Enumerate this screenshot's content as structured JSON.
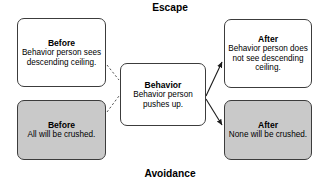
{
  "diagram": {
    "band_top_label": "Escape",
    "band_bottom_label": "Avoidance",
    "nodes": {
      "before_escape": {
        "title": "Before",
        "body": "Behavior person sees descending ceiling.",
        "fill": "#ffffff"
      },
      "before_avoidance": {
        "title": "Before",
        "body": "All will be crushed.",
        "fill": "#c9c9c9"
      },
      "behavior": {
        "title": "Behavior",
        "body": "Behavior person pushes up.",
        "fill": "#ffffff"
      },
      "after_escape": {
        "title": "After",
        "body": "Behavior person does not see descending ceiling.",
        "fill": "#ffffff"
      },
      "after_avoidance": {
        "title": "After",
        "body": "None will be crushed.",
        "fill": "#c9c9c9"
      }
    },
    "connectors": [
      {
        "name": "before-escape-to-behavior",
        "style": "dashed",
        "arrowhead": false
      },
      {
        "name": "before-avoidance-to-behavior",
        "style": "dashed",
        "arrowhead": false
      },
      {
        "name": "behavior-to-after-escape",
        "style": "solid",
        "arrowhead": true
      },
      {
        "name": "behavior-to-after-avoidance",
        "style": "solid",
        "arrowhead": true
      }
    ],
    "colors": {
      "stroke": "#3c3c3c",
      "shaded_fill": "#c9c9c9",
      "plain_fill": "#ffffff",
      "text": "#000000"
    }
  }
}
